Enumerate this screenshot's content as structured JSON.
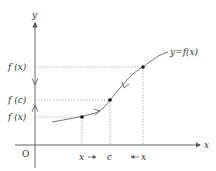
{
  "diagram": {
    "type": "function-limit-illustration",
    "axes": {
      "x_label": "x",
      "y_label": "y",
      "origin_label": "O"
    },
    "curve_label": "y=f(x)",
    "y_labels": {
      "upper": "f (x)",
      "middle": "f (c)",
      "lower": "f (x)"
    },
    "x_labels": {
      "left": "x",
      "center": "c",
      "right": "x"
    },
    "colors": {
      "axis": "#555555",
      "curve": "#666666",
      "guide": "#999999",
      "point": "#111111",
      "text": "#333333"
    }
  }
}
